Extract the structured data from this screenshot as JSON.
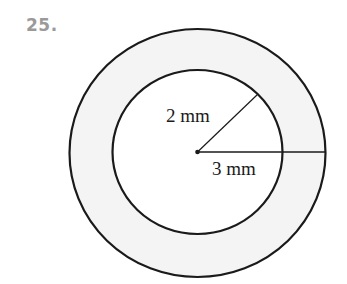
{
  "problem": {
    "number": "25."
  },
  "figure": {
    "inner_radius_label": "2 mm",
    "outer_radius_label": "3 mm",
    "colors": {
      "stroke": "#1a1a1a",
      "ring_fill": "#f4f4f4",
      "inner_fill": "#ffffff",
      "number": "#9a9a9a"
    }
  }
}
